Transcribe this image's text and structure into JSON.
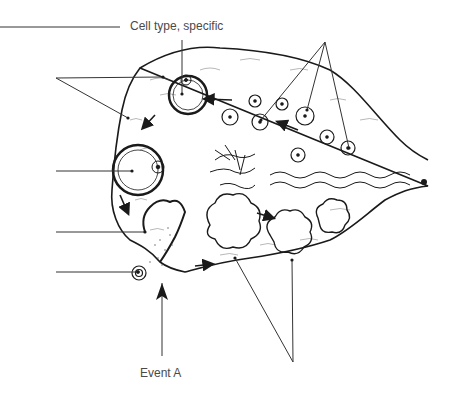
{
  "diagram": {
    "labels": {
      "top": "Cell type, specific",
      "bottom": "Event A"
    },
    "blank_leaders": [
      {
        "id": "top-left-line",
        "y": 27
      },
      {
        "id": "secondary-follicles",
        "y": 78
      },
      {
        "id": "antrum",
        "y": 171
      },
      {
        "id": "ruptured-follicle",
        "y": 232
      },
      {
        "id": "oocyte",
        "y": 272
      }
    ],
    "colors": {
      "line": "#1a1a1a",
      "leader": "#333333",
      "text": "#4a4a4a",
      "background": "#ffffff"
    }
  }
}
